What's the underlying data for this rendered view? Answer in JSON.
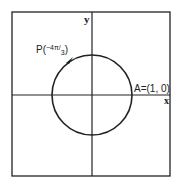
{
  "diagram": {
    "axis_x_label": "x",
    "axis_y_label": "y",
    "point_A_label": "A=(1, 0)",
    "point_P_prefix": "P(",
    "point_P_angle": "−4π/",
    "point_P_denominator": "3",
    "point_P_suffix": ")",
    "stroke_color": "#222222"
  }
}
